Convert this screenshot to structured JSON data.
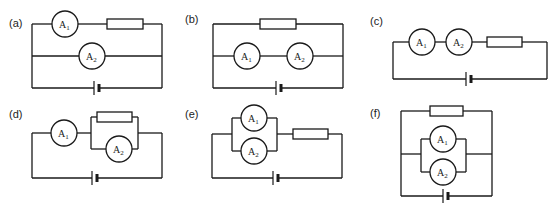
{
  "figure": {
    "line_color": "#1a1a1a",
    "background": "#ffffff"
  },
  "circuits": [
    {
      "label": "(a)",
      "meter1": "A",
      "meter1_sub": "1",
      "meter2": "A",
      "meter2_sub": "2",
      "topology": "A1 in series with resistor on top branch; A2 on middle branch in parallel; battery on bottom"
    },
    {
      "label": "(b)",
      "meter1": "A",
      "meter1_sub": "1",
      "meter2": "A",
      "meter2_sub": "2",
      "topology": "resistor on top branch; A1 and A2 in series on middle branch in parallel; battery on bottom"
    },
    {
      "label": "(c)",
      "meter1": "A",
      "meter1_sub": "1",
      "meter2": "A",
      "meter2_sub": "2",
      "topology": "A1, A2 and resistor all in series with battery"
    },
    {
      "label": "(d)",
      "meter1": "A",
      "meter1_sub": "1",
      "meter2": "A",
      "meter2_sub": "2",
      "topology": "A1 in series with (resistor parallel A2); battery on bottom"
    },
    {
      "label": "(e)",
      "meter1": "A",
      "meter1_sub": "1",
      "meter2": "A",
      "meter2_sub": "2",
      "topology": "(A1 parallel A2) in series with resistor; battery on bottom"
    },
    {
      "label": "(f)",
      "meter1": "A",
      "meter1_sub": "1",
      "meter2": "A",
      "meter2_sub": "2",
      "topology": "resistor on top branch in parallel with (A1 parallel A2); battery on bottom"
    }
  ]
}
